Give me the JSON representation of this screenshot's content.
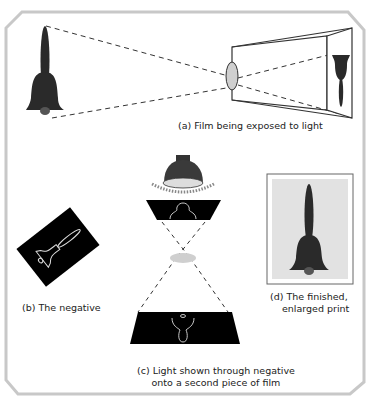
{
  "figure": {
    "panels": [
      {
        "id": "a",
        "caption": "(a) Film being exposed to light"
      },
      {
        "id": "b",
        "caption": "(b) The negative"
      },
      {
        "id": "c",
        "caption_line1": "(c) Light shown through negative",
        "caption_line2": "onto a second piece of film"
      },
      {
        "id": "d",
        "caption_line1": "(d) The finished,",
        "caption_line2": "enlarged print"
      }
    ],
    "colors": {
      "frame": "#c8c8c8",
      "bell": "#2a2a2a",
      "lens": "#cfcfcf",
      "film": "#000000",
      "print_bg": "#e2e2e2"
    }
  }
}
